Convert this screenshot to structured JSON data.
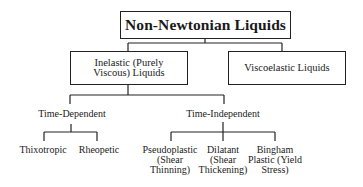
{
  "diagram": {
    "root": {
      "label": "Non-Newtonian Liquids"
    },
    "level1": [
      {
        "label_line1": "Inelastic (Purely",
        "label_line2": "Viscous) Liquids"
      },
      {
        "label": "Viscoelastic Liquids"
      }
    ],
    "level2": [
      {
        "label": "Time-Dependent"
      },
      {
        "label": "Time-Independent"
      }
    ],
    "time_dependent_children": [
      {
        "label": "Thixotropic"
      },
      {
        "label": "Rheopetic"
      }
    ],
    "time_independent_children": [
      {
        "line1": "Pseudoplastic",
        "line2": "(Shear",
        "line3": "Thinning)"
      },
      {
        "line1": "Dilatant",
        "line2": "(Shear",
        "line3": "Thickening)"
      },
      {
        "line1": "Bingham",
        "line2": "Plastic (Yield",
        "line3": "Stress)"
      }
    ],
    "line_color": "#222222"
  }
}
